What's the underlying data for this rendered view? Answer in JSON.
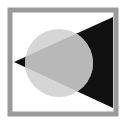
{
  "icon": {
    "name": "framed-circle-triangle-graphic",
    "colors": {
      "background": "#ffffff",
      "frame": "#9a9a9a",
      "circle": "#d6d6d6",
      "circle_overlap": "#b8b8b8",
      "triangle": "#111111"
    }
  }
}
